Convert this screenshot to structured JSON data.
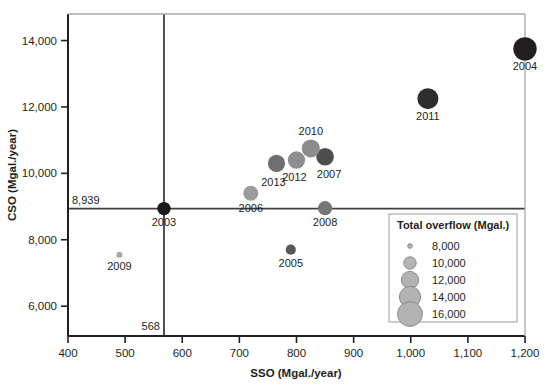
{
  "chart_data": {
    "type": "scatter",
    "title": "",
    "xlabel": "SSO (Mgal./year)",
    "ylabel": "CSO (Mgal./year)",
    "xlim": [
      400,
      1200
    ],
    "ylim": [
      5100,
      14800
    ],
    "xticks": [
      "400",
      "500",
      "600",
      "700",
      "800",
      "900",
      "1,000",
      "1,100",
      "1,200"
    ],
    "xtick_values": [
      400,
      500,
      600,
      700,
      800,
      900,
      1000,
      1100,
      1200
    ],
    "yticks": [
      "6,000",
      "8,000",
      "10,000",
      "12,000",
      "14,000"
    ],
    "ytick_values": [
      6000,
      8000,
      10000,
      12000,
      14000
    ],
    "grid": false,
    "legend_position": "bottom-right",
    "size_encoding": "Total overflow (Mgal.)",
    "reference_lines": {
      "vertical": {
        "value": 568,
        "label": "568",
        "axis": "x"
      },
      "horizontal": {
        "value": 8939,
        "label": "8,939",
        "axis": "y"
      }
    },
    "points": [
      {
        "label": "2003",
        "x": 568,
        "y": 8939,
        "size": 9507,
        "color": "#1a1a1a",
        "label_dx": 0,
        "label_dy": 17
      },
      {
        "label": "2004",
        "x": 1200,
        "y": 13750,
        "size": 14950,
        "color": "#231f20",
        "label_dx": 0,
        "label_dy": 21
      },
      {
        "label": "2005",
        "x": 790,
        "y": 7700,
        "size": 8600,
        "color": "#58585a",
        "label_dx": 0,
        "label_dy": 17
      },
      {
        "label": "2006",
        "x": 720,
        "y": 9400,
        "size": 10120,
        "color": "#9b9b9b",
        "label_dx": 0,
        "label_dy": 19
      },
      {
        "label": "2007",
        "x": 850,
        "y": 10500,
        "size": 11350,
        "color": "#4e4e4e",
        "label_dx": 4,
        "label_dy": 21
      },
      {
        "label": "2008",
        "x": 850,
        "y": 8950,
        "size": 9800,
        "color": "#777777",
        "label_dx": 0,
        "label_dy": 18
      },
      {
        "label": "2009",
        "x": 490,
        "y": 7550,
        "size": 8040,
        "color": "#a8a8a8",
        "label_dx": 0,
        "label_dy": 15
      },
      {
        "label": "2010",
        "x": 825,
        "y": 10750,
        "size": 11580,
        "color": "#8c8c8c",
        "label_dx": 0,
        "label_dy": -13
      },
      {
        "label": "2011",
        "x": 1030,
        "y": 12250,
        "size": 13280,
        "color": "#2d2d2d",
        "label_dx": 0,
        "label_dy": 21
      },
      {
        "label": "2012",
        "x": 800,
        "y": 10400,
        "size": 11200,
        "color": "#8f8f8f",
        "label_dx": -2,
        "label_dy": 21
      },
      {
        "label": "2013",
        "x": 765,
        "y": 10300,
        "size": 11050,
        "color": "#6e6e6e",
        "label_dx": -3,
        "label_dy": 23
      }
    ]
  },
  "legend": {
    "title": "Total overflow (Mgal.)",
    "entries": [
      {
        "label": "8,000",
        "value": 8000,
        "r": 2.3
      },
      {
        "label": "10,000",
        "value": 10000,
        "r": 6.2
      },
      {
        "label": "12,000",
        "value": 12000,
        "r": 8.6
      },
      {
        "label": "14,000",
        "value": 14000,
        "r": 10.6
      },
      {
        "label": "16,000",
        "value": 16000,
        "r": 12.4
      }
    ],
    "bubble_color": "#b3b3b3",
    "bubble_stroke": "#8a8a8a"
  },
  "colors": {
    "axis": "#231f20",
    "reference_line": "#3f3f3f",
    "text": "#231f20",
    "legend_border": "#9a9a9a",
    "legend_bg": "#ffffff",
    "plot_bg": "#ffffff"
  }
}
